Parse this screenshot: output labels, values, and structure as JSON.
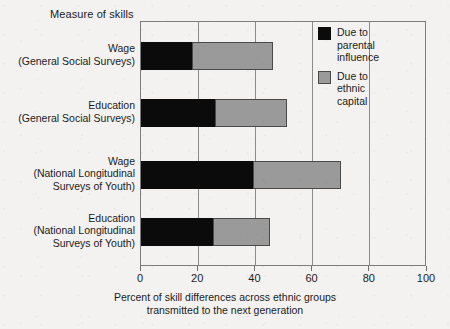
{
  "axis_title_top": "Measure of skills",
  "legend": {
    "entries": [
      {
        "key": "parental",
        "color": "#0b0b0b",
        "lines": [
          "Due to",
          "parental",
          "influence"
        ]
      },
      {
        "key": "ethnic",
        "color": "#9a9a9a",
        "lines": [
          "Due to",
          "ethnic",
          "capital"
        ]
      }
    ]
  },
  "xaxis": {
    "title_lines": [
      "Percent of skill differences across ethnic groups",
      "transmitted to the next generation"
    ],
    "ticks": [
      0,
      20,
      40,
      60,
      80,
      100
    ],
    "tick_labels": [
      "0",
      "20",
      "40",
      "60",
      "80",
      "100"
    ],
    "min": 0,
    "max": 100
  },
  "chart_data": {
    "type": "bar",
    "orientation": "horizontal",
    "stacked": true,
    "title": "Measure of skills",
    "xlabel": "Percent of skill differences across ethnic groups transmitted to the next generation",
    "ylabel": "Measure of skills",
    "xlim": [
      0,
      100
    ],
    "grid": true,
    "legend_position": "top-right",
    "categories": [
      "Wage (General Social Surveys)",
      "Education (General Social Surveys)",
      "Wage (National Longitudinal Surveys of Youth)",
      "Education (National Longitudinal Surveys of Youth)"
    ],
    "category_label_lines": [
      [
        "Wage",
        "(General Social Surveys)"
      ],
      [
        "Education",
        "(General Social Surveys)"
      ],
      [
        "Wage",
        "(National Longitudinal",
        "Surveys of Youth)"
      ],
      [
        "Education",
        "(National Longitudinal",
        "Surveys of Youth)"
      ]
    ],
    "series": [
      {
        "name": "Due to parental influence",
        "color": "#0b0b0b",
        "values": [
          18,
          26,
          39,
          25
        ]
      },
      {
        "name": "Due to ethnic capital",
        "color": "#9a9a9a",
        "values": [
          28,
          25,
          31,
          20
        ]
      }
    ],
    "totals": [
      46,
      51,
      70,
      45
    ]
  }
}
